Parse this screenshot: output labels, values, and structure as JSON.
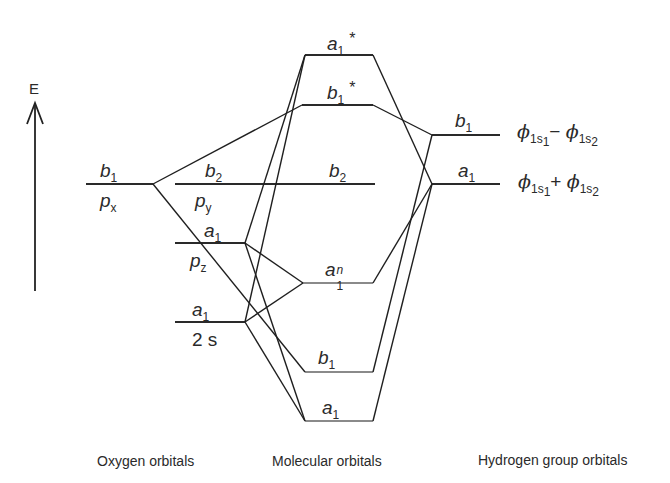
{
  "axis": {
    "label": "E"
  },
  "oxygen_orbitals": {
    "b1": {
      "symmetry": "b",
      "sub": "1",
      "orbital": "p",
      "orbital_sub": "x"
    },
    "b2": {
      "symmetry": "b",
      "sub": "2",
      "orbital": "p",
      "orbital_sub": "y"
    },
    "a1_pz": {
      "symmetry": "a",
      "sub": "1",
      "orbital": "p",
      "orbital_sub": "z"
    },
    "a1_2s": {
      "symmetry": "a",
      "sub": "1",
      "orbital": "2 s"
    }
  },
  "molecular_orbitals": {
    "a1_star": {
      "symmetry": "a",
      "sub": "1",
      "mark": "*"
    },
    "b1_star": {
      "symmetry": "b",
      "sub": "1",
      "mark": "*"
    },
    "b2": {
      "symmetry": "b",
      "sub": "2"
    },
    "a1_n": {
      "symmetry": "a",
      "sub": "1",
      "sup": "n"
    },
    "b1": {
      "symmetry": "b",
      "sub": "1"
    },
    "a1": {
      "symmetry": "a",
      "sub": "1"
    }
  },
  "hydrogen_orbitals": {
    "b1": {
      "symmetry": "b",
      "sub": "1",
      "phi": "ϕ",
      "term1": "1s",
      "t1sub": "1",
      "op": "−",
      "term2": "1s",
      "t2sub": "2"
    },
    "a1": {
      "symmetry": "a",
      "sub": "1",
      "phi": "ϕ",
      "term1": "1s",
      "t1sub": "1",
      "op": "+",
      "term2": "1s",
      "t2sub": "2"
    }
  },
  "captions": {
    "oxygen": "Oxygen orbitals",
    "molecular": "Molecular orbitals",
    "hydrogen": "Hydrogen group orbitals"
  }
}
